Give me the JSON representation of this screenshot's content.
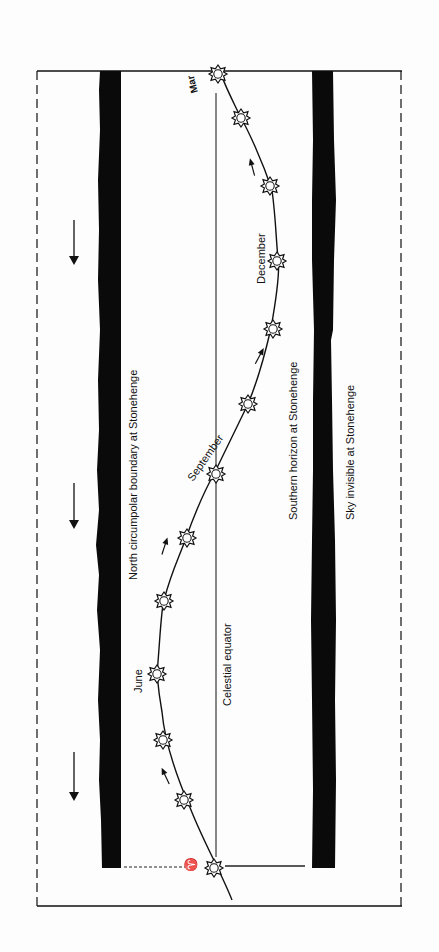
{
  "diagram": {
    "orientation": "rotated 90 degrees counter-clockwise (text reads bottom-to-top)",
    "labels": {
      "north_boundary": "North circumpolar boundary at Stonehenge",
      "celestial_equator": "Celestial equator",
      "southern_horizon": "Southern horizon at Stonehenge",
      "sky_invisible": "Sky invisible at Stonehenge",
      "june": "June",
      "september": "September",
      "december": "December",
      "march": "Mar",
      "aries_symbol": "♈"
    },
    "sun_markers_count": 13,
    "colors": {
      "ink": "#111111",
      "band": "#0a0a0a",
      "background": "#fdfdfd"
    }
  }
}
